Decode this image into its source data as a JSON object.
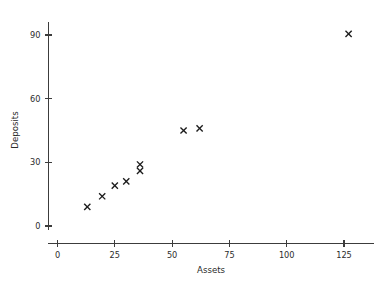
{
  "chart_data": {
    "type": "scatter",
    "title": "",
    "xlabel": "Assets",
    "ylabel": "Deposits",
    "xlim": [
      0,
      138
    ],
    "ylim": [
      0,
      96
    ],
    "xticks": [
      0,
      25,
      50,
      75,
      100,
      125
    ],
    "xtick_labels": [
      "0",
      "25",
      "50",
      "75",
      "100",
      "125"
    ],
    "yticks": [
      0,
      30,
      60,
      90
    ],
    "ytick_labels": [
      "0",
      "30",
      "60",
      "90"
    ],
    "grid": false,
    "legend": false,
    "marker": "x",
    "marker_color": "#1c1c1c",
    "points": [
      {
        "x": 13,
        "y": 9
      },
      {
        "x": 19.5,
        "y": 14
      },
      {
        "x": 25,
        "y": 19
      },
      {
        "x": 30,
        "y": 21
      },
      {
        "x": 36,
        "y": 26
      },
      {
        "x": 36,
        "y": 29
      },
      {
        "x": 55,
        "y": 45
      },
      {
        "x": 62,
        "y": 46
      },
      {
        "x": 127,
        "y": 90.5
      }
    ],
    "x": [
      13,
      19.5,
      25,
      30,
      36,
      36,
      55,
      62,
      127
    ],
    "y": [
      9,
      14,
      19,
      21,
      26,
      29,
      45,
      46,
      90.5
    ]
  }
}
